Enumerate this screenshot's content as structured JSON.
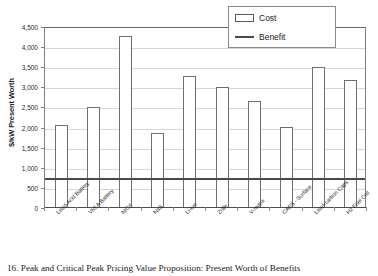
{
  "chart_data": {
    "type": "bar",
    "title": "",
    "xlabel": "",
    "ylabel": "$/kW Present Worth",
    "ylim": [
      0,
      4500
    ],
    "ytick_step": 500,
    "yticks": [
      "0",
      "500",
      "1,000",
      "1,500",
      "2,000",
      "2,500",
      "3,000",
      "3,500",
      "4,000",
      "4,500"
    ],
    "grid": true,
    "legend_position": "top-right",
    "categories": [
      "Lead-Acid Battery",
      "VRLA Battery",
      "NiCd",
      "NaS",
      "Li-Ion",
      "ZnBr",
      "V-redox",
      "CAES - Surface",
      "Lead-carbon Caps",
      "H2 Fuel Cell"
    ],
    "series": [
      {
        "name": "Cost",
        "type": "bar",
        "color": "#ffffff",
        "edge_color": "#707070",
        "values": [
          2060,
          2520,
          4280,
          1870,
          3280,
          3020,
          2650,
          2020,
          3510,
          3180
        ]
      },
      {
        "name": "Benefit",
        "type": "line",
        "color": "#4a4a4a",
        "constant_value": 750,
        "values": [
          750,
          750,
          750,
          750,
          750,
          750,
          750,
          750,
          750,
          750
        ]
      }
    ]
  },
  "legend": {
    "items": [
      {
        "label": "Cost",
        "kind": "box"
      },
      {
        "label": "Benefit",
        "kind": "line"
      }
    ]
  },
  "caption": {
    "text": "16. Peak and Critical Peak Pricing Value Proposition: Present Worth of Benefits"
  },
  "colors": {
    "bar_fill": "#ffffff",
    "bar_edge": "#707070",
    "benefit_line": "#4a4a4a",
    "gridline": "#d6d6d6",
    "axis": "#808080",
    "text": "#1a1a1a",
    "background": "#ffffff"
  }
}
